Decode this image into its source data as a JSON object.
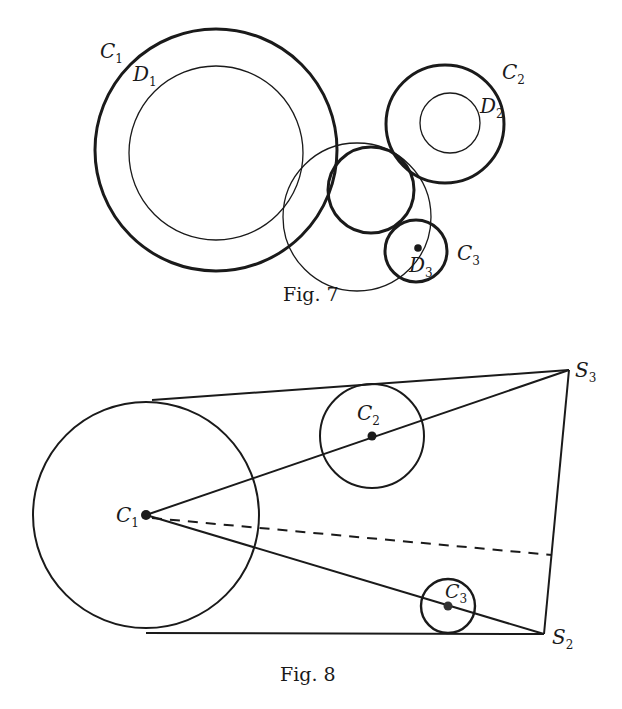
{
  "colors": {
    "ink": "#1a1a1a",
    "background": "#ffffff"
  },
  "fig7": {
    "caption": "Fig. 7",
    "labels": {
      "C1": {
        "main": "C",
        "sub": "1"
      },
      "D1": {
        "main": "D",
        "sub": "1"
      },
      "C2": {
        "main": "C",
        "sub": "2"
      },
      "D2": {
        "main": "D",
        "sub": "2"
      },
      "C3": {
        "main": "C",
        "sub": "3"
      },
      "D3": {
        "main": "D",
        "sub": "3"
      }
    },
    "circles": [
      {
        "name": "C1",
        "cx": 216,
        "cy": 150,
        "r": 121,
        "weight": "thick"
      },
      {
        "name": "D1",
        "cx": 216,
        "cy": 153,
        "r": 87,
        "weight": "thin"
      },
      {
        "name": "outer-thin",
        "cx": 357,
        "cy": 217,
        "r": 74,
        "weight": "thin"
      },
      {
        "name": "middle",
        "cx": 371,
        "cy": 190,
        "r": 43,
        "weight": "thick"
      },
      {
        "name": "C2",
        "cx": 445,
        "cy": 124,
        "r": 59,
        "weight": "thick"
      },
      {
        "name": "D2",
        "cx": 450,
        "cy": 123,
        "r": 30,
        "weight": "thin"
      },
      {
        "name": "C3",
        "cx": 416,
        "cy": 251,
        "r": 31,
        "weight": "thick"
      }
    ],
    "points": [
      {
        "name": "D3",
        "x": 418,
        "y": 248
      }
    ]
  },
  "fig8": {
    "caption": "Fig. 8",
    "labels": {
      "C1": {
        "main": "C",
        "sub": "1"
      },
      "C2": {
        "main": "C",
        "sub": "2"
      },
      "C3": {
        "main": "C",
        "sub": "3"
      },
      "S2": {
        "main": "S",
        "sub": "2"
      },
      "S3": {
        "main": "S",
        "sub": "3"
      }
    },
    "circles": [
      {
        "name": "C1",
        "cx": 146,
        "cy": 515,
        "r": 113
      },
      {
        "name": "C2",
        "cx": 372,
        "cy": 436,
        "r": 52
      },
      {
        "name": "C3",
        "cx": 448,
        "cy": 606,
        "r": 27
      }
    ],
    "points": {
      "C1": {
        "x": 146,
        "y": 515
      },
      "C2": {
        "x": 372,
        "y": 436
      },
      "C3": {
        "x": 448,
        "y": 606
      },
      "S2": {
        "x": 544,
        "y": 634
      },
      "S3": {
        "x": 569,
        "y": 370
      },
      "dash_end": {
        "x": 552,
        "y": 555
      }
    }
  }
}
